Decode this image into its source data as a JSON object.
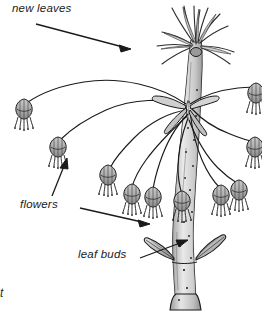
{
  "figure": {
    "kind": "botanical-line-drawing",
    "style": "pen-and-ink with gray wash",
    "width": 262,
    "height": 312,
    "colors": {
      "background": "#ffffff",
      "ink": "#1a1a1a",
      "wash_light": "#d8d8d8",
      "wash_mid": "#b0b0b0",
      "wash_dark": "#808080",
      "label_text": "#1a1a1a"
    }
  },
  "labels": {
    "new_leaves": "new leaves",
    "flowers": "flowers",
    "leaf_buds": "leaf buds",
    "corner_fragment": "t"
  },
  "callouts": [
    {
      "name": "new-leaves",
      "text": "new leaves",
      "arrow": "points right and down to the leaf spray at the branch apex"
    },
    {
      "name": "flowers",
      "text": "flowers",
      "arrow": "points right and down to a nodding bell flower"
    },
    {
      "name": "leaf-buds",
      "text": "leaf buds",
      "arrow": "points up and right to the pointed buds on the stem"
    }
  ],
  "parts": {
    "main_stem": "speckled upright stem with lenticels, flaring at base",
    "new_leaves": "spray of narrow emerging leaves at apex",
    "pedicels": "long arching flower stalks radiating from the node",
    "flowers": "bell-shaped nodding flowers with dangling stamens",
    "leaf_buds": "pair of pointed lens-shaped buds at a lower node"
  }
}
